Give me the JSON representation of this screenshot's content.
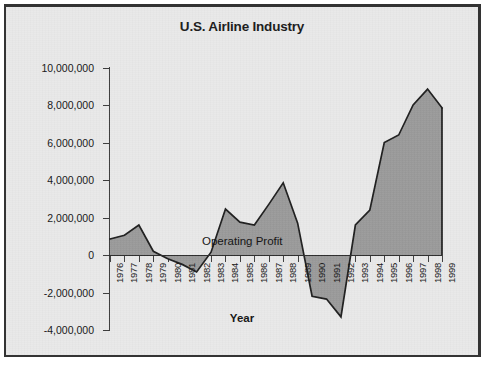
{
  "figure": {
    "background_color": "#e9e9e9",
    "border_color": "#333333",
    "title": "U.S. Airline Industry"
  },
  "chart_data": {
    "type": "area",
    "title": "U.S. Airline Industry",
    "subtitle": "",
    "xlabel": "Year",
    "ylabel": "$ in Thousands",
    "grid": false,
    "legend_position": "inline-annotation",
    "annotations": [
      {
        "text": "Operating Profit",
        "x": 1983.5,
        "y": 600000
      }
    ],
    "series_name": "Operating Profit",
    "series_color": "#9a9a9a",
    "line_color": "#1e1e1e",
    "xlim": [
      1976,
      1999
    ],
    "ylim": [
      -4000000,
      10000000
    ],
    "ytick_values": [
      10000000,
      8000000,
      6000000,
      4000000,
      2000000,
      0,
      -2000000,
      -4000000
    ],
    "ytick_labels": [
      "10,000,000",
      "8,000,000",
      "6,000,000",
      "4,000,000",
      "2,000,000",
      "0",
      "-2,000,000",
      "-4,000,000"
    ],
    "categories": [
      "1976",
      "1977",
      "1978",
      "1979",
      "1980",
      "1981",
      "1982",
      "1983",
      "1984",
      "1985",
      "1986",
      "1987",
      "1988",
      "1989",
      "1990",
      "1991",
      "1992",
      "1993",
      "1994",
      "1995",
      "1996",
      "1997",
      "1998",
      "1999"
    ],
    "values": [
      850000,
      1050000,
      1600000,
      200000,
      -200000,
      -500000,
      -900000,
      150000,
      2450000,
      1750000,
      1600000,
      2700000,
      3850000,
      1700000,
      -2200000,
      -2350000,
      -3300000,
      1600000,
      2400000,
      6000000,
      6400000,
      8000000,
      8850000,
      7850000
    ]
  }
}
